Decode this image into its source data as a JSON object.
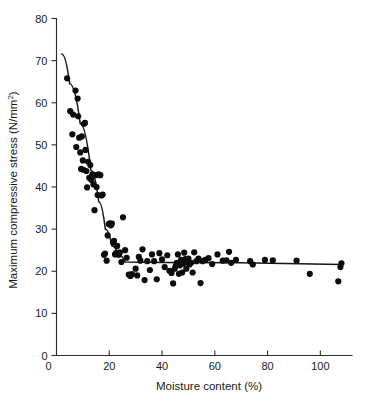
{
  "chart_data": {
    "type": "scatter",
    "title": "",
    "subtitle": "",
    "xlabel": "Moisture content (%)",
    "ylabel": "Maximum compressive stress (N/mm2)",
    "ylabel_text": "Maximum compressive stress (N/mm",
    "ylabel_sup": "2",
    "ylabel_tail": ")",
    "xlim": [
      0,
      112
    ],
    "ylim": [
      0,
      80
    ],
    "xticks": [
      0,
      20,
      40,
      60,
      80,
      100
    ],
    "xtick_labels": [
      "0",
      "20",
      "40",
      "60",
      "80",
      "100"
    ],
    "yticks": [
      0,
      10,
      20,
      30,
      40,
      50,
      60,
      70,
      80
    ],
    "ytick_labels": [
      "0",
      "10",
      "20",
      "30",
      "40",
      "50",
      "60",
      "70",
      "80"
    ],
    "grid": false,
    "legend": null,
    "marker": "filled-circle",
    "marker_color": "#0d0d0d",
    "marker_size_px": 3.1,
    "line_color": "#151515",
    "x": [
      4.0,
      5.2,
      6.0,
      6.3,
      7.2,
      7.5,
      8.0,
      8.2,
      8.6,
      9.0,
      9.3,
      9.6,
      10.0,
      10.2,
      10.4,
      10.8,
      11.0,
      11.3,
      11.6,
      12.0,
      12.4,
      12.8,
      13.2,
      13.6,
      14.0,
      14.4,
      14.8,
      15.2,
      15.6,
      16.0,
      16.6,
      17.0,
      17.5,
      18.0,
      18.4,
      19.0,
      19.4,
      19.8,
      20.2,
      20.6,
      21.0,
      21.4,
      21.8,
      22.2,
      22.6,
      23.0,
      23.6,
      24.0,
      24.6,
      25.2,
      26.0,
      26.6,
      27.4,
      28.0,
      28.6,
      30.0,
      30.6,
      31.2,
      31.8,
      32.6,
      33.4,
      34.4,
      35.4,
      36.2,
      37.0,
      38.0,
      39.0,
      40.0,
      41.0,
      42.0,
      42.8,
      43.6,
      44.2,
      44.8,
      45.2,
      45.6,
      46.0,
      46.4,
      46.8,
      47.2,
      47.6,
      48.0,
      48.4,
      48.8,
      49.2,
      49.6,
      50.0,
      50.4,
      51.0,
      51.6,
      52.2,
      53.0,
      53.8,
      54.6,
      55.4,
      56.4,
      57.6,
      59.0,
      61.0,
      63.0,
      64.4,
      65.4,
      66.2,
      68.0,
      73.4,
      74.4,
      79.0,
      82.0,
      91.0,
      96.0,
      106.8,
      107.6,
      108.0
    ],
    "y": [
      65.8,
      58.0,
      52.5,
      57.2,
      62.9,
      49.5,
      61.0,
      56.8,
      51.7,
      48.2,
      44.3,
      52.0,
      46.3,
      44.1,
      55.0,
      55.2,
      48.8,
      43.8,
      39.9,
      46.0,
      42.2,
      45.2,
      41.7,
      43.0,
      40.6,
      34.5,
      42.8,
      40.0,
      38.1,
      43.0,
      42.8,
      38.0,
      38.2,
      23.9,
      24.2,
      22.5,
      28.5,
      31.2,
      31.4,
      30.9,
      31.3,
      26.8,
      27.2,
      24.0,
      24.3,
      26.0,
      23.9,
      24.5,
      22.2,
      32.8,
      25.0,
      23.2,
      19.2,
      18.9,
      19.3,
      20.6,
      19.0,
      23.4,
      22.5,
      25.2,
      17.9,
      22.4,
      20.3,
      24.0,
      22.4,
      18.1,
      24.3,
      22.8,
      21.0,
      23.8,
      20.1,
      19.6,
      17.1,
      20.6,
      21.3,
      22.0,
      24.0,
      19.4,
      21.4,
      22.7,
      19.7,
      21.8,
      24.4,
      22.9,
      20.6,
      22.2,
      23.0,
      21.6,
      22.0,
      19.7,
      24.5,
      22.4,
      23.0,
      17.2,
      22.4,
      22.7,
      23.1,
      21.7,
      24.0,
      22.5,
      22.6,
      24.6,
      22.0,
      22.7,
      22.4,
      21.6,
      22.7,
      22.6,
      22.5,
      19.4,
      17.6,
      21.0,
      21.9,
      21.4
    ],
    "fit_line": {
      "description": "bilinear fit: steep decline then plateau",
      "points": [
        [
          2.0,
          71.6
        ],
        [
          5.0,
          64.5
        ],
        [
          9.0,
          55.0
        ],
        [
          13.0,
          44.0
        ],
        [
          16.0,
          36.5
        ],
        [
          18.5,
          30.0
        ],
        [
          21.0,
          26.0
        ],
        [
          23.5,
          24.0
        ],
        [
          26.0,
          22.2
        ],
        [
          40.0,
          22.1
        ],
        [
          70.0,
          22.0
        ],
        [
          108.0,
          21.6
        ]
      ]
    }
  }
}
